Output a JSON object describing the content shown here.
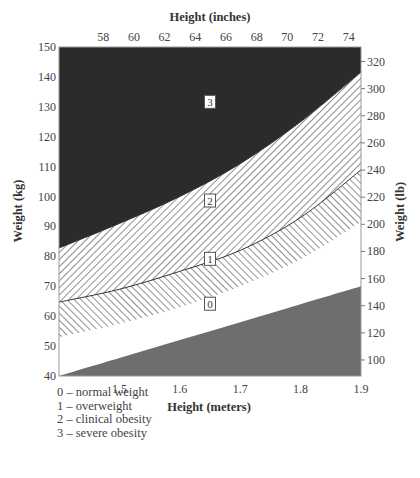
{
  "chart_data": {
    "type": "area",
    "title": "",
    "top_xlabel": "Height (inches)",
    "xlabel": "Height (meters)",
    "ylabel": "Weight (kg)",
    "ylabel_right": "Weight (lb)",
    "xlim": [
      1.4,
      1.9
    ],
    "ylim": [
      40,
      150
    ],
    "x_ticks": [
      1.5,
      1.6,
      1.7,
      1.8,
      1.9
    ],
    "x_tick_labels": [
      "1.5",
      "1.6",
      "1.7",
      "1.8",
      "1.9"
    ],
    "top_x_ticks": [
      58,
      60,
      62,
      64,
      66,
      68,
      70,
      72,
      74
    ],
    "y_ticks": [
      40,
      50,
      60,
      70,
      80,
      90,
      100,
      110,
      120,
      130,
      140,
      150
    ],
    "y_right_ticks": [
      100,
      120,
      140,
      160,
      180,
      200,
      220,
      240,
      260,
      280,
      300,
      320
    ],
    "grid": false,
    "x": [
      1.4,
      1.5,
      1.6,
      1.7,
      1.8,
      1.9
    ],
    "boundaries": [
      {
        "name": "severe/clinical boundary (3|2)",
        "values": [
          82.8,
          91,
          100,
          111,
          125,
          141.6
        ]
      },
      {
        "name": "clinical/overweight boundary (2|1)",
        "values": [
          64.7,
          69,
          75,
          82,
          93,
          108.9
        ]
      },
      {
        "name": "overweight/normal boundary (1|0)",
        "values": [
          53,
          57.5,
          63,
          70,
          79,
          91.5
        ]
      },
      {
        "name": "normal/underweight boundary (0|shaded)",
        "values": [
          40,
          46,
          52,
          58,
          64,
          70
        ]
      }
    ],
    "regions": [
      {
        "id": "3",
        "name": "severe obesity",
        "fill": "#2b2b2b",
        "pattern": "solid",
        "label_pos": [
          1.65,
          131.5
        ]
      },
      {
        "id": "2",
        "name": "clinical obesity",
        "fill": "#ffffff",
        "pattern": "hatch-backslash",
        "label_pos": [
          1.65,
          98.5
        ]
      },
      {
        "id": "1",
        "name": "overweight",
        "fill": "#ffffff",
        "pattern": "hatch-slash",
        "label_pos": [
          1.65,
          79
        ]
      },
      {
        "id": "0",
        "name": "normal weight",
        "fill": "#ffffff",
        "pattern": "none",
        "label_pos": [
          1.65,
          64
        ]
      },
      {
        "id": "",
        "name": "underweight (shaded)",
        "fill": "#6e6e6e",
        "pattern": "solid"
      }
    ],
    "legend": [
      "0 – normal weight",
      "1 – overweight",
      "2 – clinical obesity",
      "3 – severe obesity"
    ],
    "legend_position": "bottom-left"
  }
}
